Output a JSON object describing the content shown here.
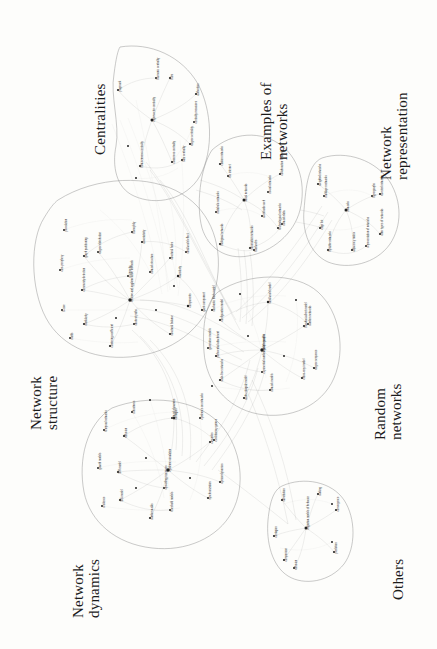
{
  "figure": {
    "orientation": "rotated-90",
    "background_color": "#fdfdfb",
    "node_color": "#232323",
    "edge_color": "#6f6f6f",
    "hull_color": "#8d8d8d"
  },
  "clusters": [
    {
      "id": "centralities",
      "label": "Centralities",
      "x": 92,
      "y": 155
    },
    {
      "id": "examples",
      "label": "Examples of\nnetworks",
      "x": 258,
      "y": 160
    },
    {
      "id": "representation",
      "label": "Network\nrepresentation",
      "x": 378,
      "y": 180
    },
    {
      "id": "structure",
      "label": "Network\nstructure",
      "x": 28,
      "y": 430
    },
    {
      "id": "dynamics",
      "label": "Network\ndynamics",
      "x": 70,
      "y": 618
    },
    {
      "id": "random",
      "label": "Random\nnetworks",
      "x": 372,
      "y": 440
    },
    {
      "id": "others",
      "label": "Others",
      "x": 390,
      "y": 600
    }
  ],
  "node_labels": {
    "centralities": [
      "eigenvector centrality",
      "closeness centrality",
      "betweenness centrality",
      "degree centrality",
      "pagerank",
      "hubs",
      "authorities",
      "katz centrality",
      "harmonic centrality",
      "centrality measures"
    ],
    "examples": [
      "social networks",
      "information networks",
      "biological networks",
      "technological networks",
      "citation networks",
      "collaboration networks",
      "network data",
      "food webs",
      "the internet",
      "world wide web",
      "metabolic networks",
      "neural networks"
    ],
    "representation": [
      "networks",
      "adjacency matrix",
      "bipartite networks",
      "directed networks",
      "weighted networks",
      "other types of networks",
      "representation of networks",
      "multilayer networks",
      "hypergraphs",
      "edge list"
    ],
    "structure": [
      "divisive and agglomerative methods",
      "graph partitioning",
      "community detection",
      "modularity",
      "assortativity",
      "transitivity",
      "structural balance",
      "clustering coefficient",
      "degree distribution",
      "components",
      "structural holes",
      "homophily",
      "reciprocity",
      "shortest paths",
      "small world effect",
      "giant component",
      "percolation",
      "core-periphery",
      "k-core",
      "motifs",
      "network structure"
    ],
    "dynamics": [
      "epidemic simulation",
      "diffusion",
      "SIR model",
      "SIS model",
      "contagion",
      "cascades",
      "synchronization",
      "random walks",
      "opinion dynamics",
      "network dynamics",
      "spreading processes",
      "threshold models",
      "evolutionary games",
      "temporal networks",
      "growth models",
      "resilience",
      "robustness",
      "epidemics on networks"
    ],
    "random": [
      "random graphs",
      "configuration model",
      "preferential attachment",
      "scale-free networks",
      "small world model",
      "barabasi-albert model",
      "erdos-renyi model",
      "watts-strogatz model",
      "degree sequence",
      "exponential random graph models",
      "network models",
      "random networks",
      "stochastic block model",
      "generative models"
    ],
    "others": [
      "migration models of behavior",
      "substitution",
      "contagion",
      "comparison",
      "ranking",
      "convergence",
      "prediction",
      "diffusion"
    ]
  }
}
